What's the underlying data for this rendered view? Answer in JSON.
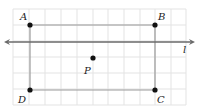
{
  "figure": {
    "grid": {
      "x_lines": [
        13,
        29,
        45,
        61,
        77,
        93,
        108,
        124,
        140,
        155,
        171,
        186
      ],
      "y_lines": [
        9,
        25,
        41,
        57,
        73,
        89,
        105
      ],
      "color": "#e3e3e3"
    },
    "rectangle": {
      "color": "#9a9a9a",
      "vertices": [
        "A",
        "B",
        "C",
        "D"
      ]
    },
    "line_l": {
      "label": "l",
      "y": 42,
      "x1": 4,
      "x2": 195,
      "color": "#6a6a6a"
    },
    "points": [
      {
        "name": "A",
        "x": 30,
        "y": 25,
        "lx": 20,
        "ly": 20
      },
      {
        "name": "B",
        "x": 155,
        "y": 25,
        "lx": 158,
        "ly": 20
      },
      {
        "name": "C",
        "x": 155,
        "y": 90,
        "lx": 157,
        "ly": 103
      },
      {
        "name": "D",
        "x": 30,
        "y": 90,
        "lx": 18,
        "ly": 103
      },
      {
        "name": "P",
        "x": 93,
        "y": 58,
        "lx": 84,
        "ly": 74
      }
    ],
    "line_label_pos": {
      "x": 183,
      "y": 53
    }
  }
}
